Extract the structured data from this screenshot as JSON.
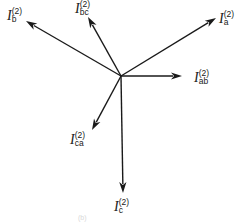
{
  "diagram": {
    "origin": {
      "x": 121,
      "y": 76
    },
    "line_color": "#1a1a1a",
    "background": "#ffffff",
    "phasors": [
      {
        "id": "Ib",
        "symbol": "I",
        "superscript": "(2)",
        "subscript": "b",
        "tip": {
          "x": 26,
          "y": 21
        },
        "label_pos": {
          "x": 7,
          "y": 7
        }
      },
      {
        "id": "Ibc",
        "symbol": "I",
        "superscript": "(2)",
        "subscript": "bc",
        "tip": {
          "x": 88,
          "y": 17
        },
        "label_pos": {
          "x": 75,
          "y": 0
        }
      },
      {
        "id": "Ia",
        "symbol": "I",
        "superscript": "(2)",
        "subscript": "a",
        "tip": {
          "x": 216,
          "y": 18
        },
        "label_pos": {
          "x": 219,
          "y": 10
        }
      },
      {
        "id": "Iab",
        "symbol": "I",
        "superscript": "(2)",
        "subscript": "ab",
        "tip": {
          "x": 182,
          "y": 76
        },
        "label_pos": {
          "x": 194,
          "y": 69
        }
      },
      {
        "id": "Ica",
        "symbol": "I",
        "superscript": "(2)",
        "subscript": "ca",
        "tip": {
          "x": 92,
          "y": 130
        },
        "label_pos": {
          "x": 70,
          "y": 131
        }
      },
      {
        "id": "Ic",
        "symbol": "I",
        "superscript": "(2)",
        "subscript": "c",
        "tip": {
          "x": 123,
          "y": 193
        },
        "label_pos": {
          "x": 114,
          "y": 198
        }
      }
    ],
    "caption": "(b)"
  }
}
